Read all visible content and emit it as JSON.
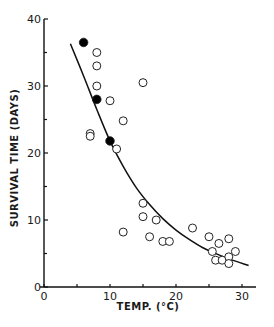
{
  "chart_data": {
    "type": "scatter",
    "title": "",
    "xlabel": "TEMP. (°C)",
    "ylabel": "SURVIVAL TIME (DAYS)",
    "xlim": [
      0,
      32
    ],
    "ylim": [
      0,
      40
    ],
    "x_ticks": [
      0,
      10,
      20,
      30
    ],
    "y_ticks": [
      0,
      10,
      20,
      30,
      40
    ],
    "grid": false,
    "legend": null,
    "series": [
      {
        "name": "filled",
        "marker": "filled-circle",
        "color": "#000000",
        "points": [
          {
            "x": 6,
            "y": 36.5
          },
          {
            "x": 8,
            "y": 28
          },
          {
            "x": 10,
            "y": 21.8
          }
        ]
      },
      {
        "name": "open",
        "marker": "open-circle",
        "color": "#000000",
        "points": [
          {
            "x": 8,
            "y": 35
          },
          {
            "x": 8,
            "y": 33
          },
          {
            "x": 8,
            "y": 30
          },
          {
            "x": 10,
            "y": 27.8
          },
          {
            "x": 12,
            "y": 24.8
          },
          {
            "x": 7,
            "y": 22.9
          },
          {
            "x": 7,
            "y": 22.5
          },
          {
            "x": 11,
            "y": 20.6
          },
          {
            "x": 15,
            "y": 30.5
          },
          {
            "x": 12,
            "y": 8.2
          },
          {
            "x": 15,
            "y": 12.5
          },
          {
            "x": 15,
            "y": 10.5
          },
          {
            "x": 17,
            "y": 10
          },
          {
            "x": 16,
            "y": 7.5
          },
          {
            "x": 18,
            "y": 6.8
          },
          {
            "x": 19,
            "y": 6.8
          },
          {
            "x": 22.5,
            "y": 8.8
          },
          {
            "x": 25,
            "y": 7.5
          },
          {
            "x": 25.5,
            "y": 5.3
          },
          {
            "x": 26.5,
            "y": 6.5
          },
          {
            "x": 28,
            "y": 7.2
          },
          {
            "x": 29,
            "y": 5.3
          },
          {
            "x": 26,
            "y": 4
          },
          {
            "x": 27,
            "y": 4
          },
          {
            "x": 28,
            "y": 4.5
          },
          {
            "x": 28,
            "y": 3.5
          }
        ]
      },
      {
        "name": "fitted curve",
        "marker": "line",
        "color": "#000000",
        "points": [
          {
            "x": 4,
            "y": 36.3
          },
          {
            "x": 6,
            "y": 31.5
          },
          {
            "x": 8,
            "y": 26.5
          },
          {
            "x": 10,
            "y": 21.8
          },
          {
            "x": 12,
            "y": 18
          },
          {
            "x": 14,
            "y": 14.8
          },
          {
            "x": 16,
            "y": 12.3
          },
          {
            "x": 18,
            "y": 10.2
          },
          {
            "x": 20,
            "y": 8.5
          },
          {
            "x": 22,
            "y": 7.1
          },
          {
            "x": 24,
            "y": 5.9
          },
          {
            "x": 26,
            "y": 5
          },
          {
            "x": 28,
            "y": 4.2
          },
          {
            "x": 31,
            "y": 3.2
          }
        ]
      }
    ]
  },
  "axes": {
    "x_title": "TEMP. (°C)",
    "y_title": "SURVIVAL TIME (DAYS)",
    "x_tick_labels": [
      "0",
      "10",
      "20",
      "30"
    ],
    "y_tick_labels": [
      "0",
      "10",
      "20",
      "30",
      "40"
    ]
  }
}
